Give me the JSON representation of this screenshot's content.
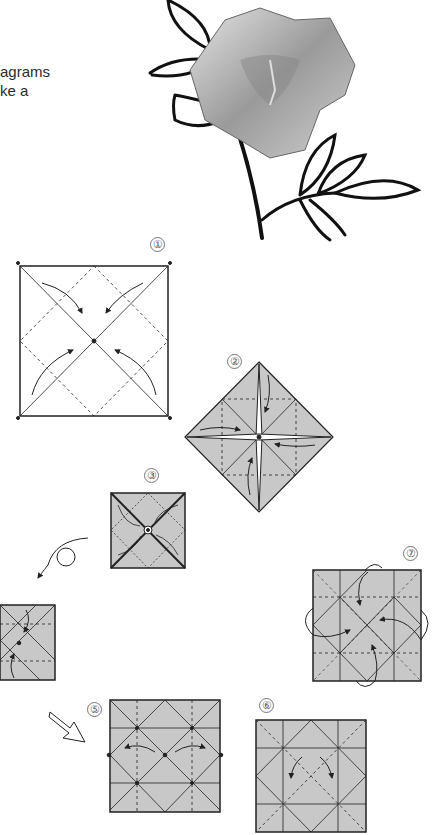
{
  "page": {
    "intro_text": [
      "agrams",
      "ke a"
    ]
  },
  "illustration": {
    "subject": "origami rose with drawn stem and leaves"
  },
  "steps": [
    {
      "number": "1",
      "label": "①"
    },
    {
      "number": "2",
      "label": "②"
    },
    {
      "number": "3",
      "label": "③"
    },
    {
      "number": "4",
      "label": ""
    },
    {
      "number": "5",
      "label": "⑤"
    },
    {
      "number": "6",
      "label": "⑥"
    },
    {
      "number": "7",
      "label": "⑦"
    }
  ],
  "colors": {
    "paper_fill": "#c8c8c8",
    "line": "#222222",
    "text": "#2b2b2b"
  }
}
